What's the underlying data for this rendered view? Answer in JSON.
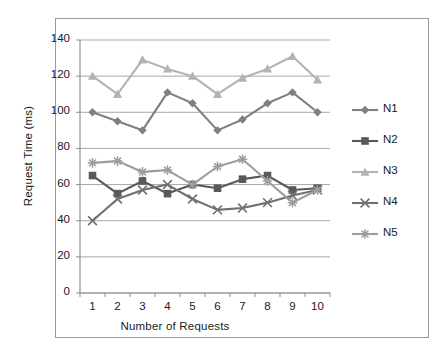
{
  "chart_data": {
    "type": "line",
    "title": "",
    "xlabel": "Number of Requests",
    "ylabel": "Request Time (ms)",
    "x": [
      1,
      2,
      3,
      4,
      5,
      6,
      7,
      8,
      9,
      10
    ],
    "categories": [
      "1",
      "2",
      "3",
      "4",
      "5",
      "6",
      "7",
      "8",
      "9",
      "10"
    ],
    "xlim": [
      0.5,
      10.5
    ],
    "ylim": [
      0,
      140
    ],
    "yticks": [
      0,
      20,
      40,
      60,
      80,
      100,
      120,
      140
    ],
    "ytick_labels": [
      "0",
      "20",
      "40",
      "60",
      "80",
      "100",
      "120",
      "140"
    ],
    "xtick_labels": [
      "1",
      "2",
      "3",
      "4",
      "5",
      "6",
      "7",
      "8",
      "9",
      "10"
    ],
    "grid": "horizontal",
    "legend_position": "right",
    "series": [
      {
        "name": "N1",
        "marker": "diamond",
        "color": "#808080",
        "values": [
          100,
          95,
          90,
          111,
          105,
          90,
          96,
          105,
          111,
          100
        ]
      },
      {
        "name": "N2",
        "marker": "square",
        "color": "#595959",
        "values": [
          65,
          55,
          62,
          55,
          60,
          58,
          63,
          65,
          57,
          58
        ]
      },
      {
        "name": "N3",
        "marker": "triangle",
        "color": "#b3b3b3",
        "values": [
          120,
          110,
          129,
          124,
          120,
          110,
          119,
          124,
          131,
          118
        ]
      },
      {
        "name": "N4",
        "marker": "x",
        "color": "#707070",
        "values": [
          40,
          52,
          57,
          60,
          52,
          46,
          47,
          50,
          54,
          57
        ]
      },
      {
        "name": "N5",
        "marker": "asterisk",
        "color": "#9d9d9d",
        "values": [
          72,
          73,
          67,
          68,
          60,
          70,
          74,
          62,
          50,
          57
        ]
      }
    ]
  },
  "legend": {
    "items": [
      {
        "label": "N1"
      },
      {
        "label": "N2"
      },
      {
        "label": "N3"
      },
      {
        "label": "N4"
      },
      {
        "label": "N5"
      }
    ]
  }
}
